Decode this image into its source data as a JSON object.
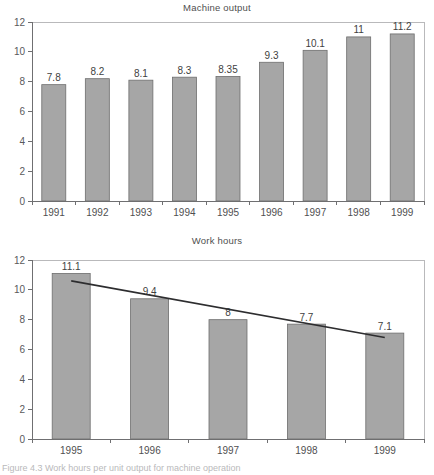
{
  "figure": {
    "caption": "Figure 4.3   Work hours per unit output for machine operation"
  },
  "charts": [
    {
      "id": "machine-output",
      "title": "Machine output"
    },
    {
      "id": "work-hours",
      "title": "Work hours"
    }
  ],
  "chart_data": [
    {
      "type": "bar",
      "title": "Machine output",
      "xlabel": "",
      "ylabel": "",
      "categories": [
        "1991",
        "1992",
        "1993",
        "1994",
        "1995",
        "1996",
        "1997",
        "1998",
        "1999"
      ],
      "values": [
        7.8,
        8.2,
        8.1,
        8.3,
        8.35,
        9.3,
        10.1,
        11,
        11.2
      ],
      "value_labels": [
        "7.8",
        "8.2",
        "8.1",
        "8.3",
        "8.35",
        "9.3",
        "10.1",
        "11",
        "11.2"
      ],
      "ylim": [
        0,
        12
      ],
      "yticks": [
        0,
        2,
        4,
        6,
        8,
        10,
        12
      ],
      "ytick_labels": [
        "0",
        "2",
        "4",
        "6",
        "8",
        "10",
        "12"
      ],
      "grid": false,
      "legend": "none",
      "bar_color": "#a6a6a6",
      "bar_edge_color": "#6e6e6e"
    },
    {
      "type": "bar",
      "title": "Work hours",
      "xlabel": "",
      "ylabel": "",
      "categories": [
        "1995",
        "1996",
        "1997",
        "1998",
        "1999"
      ],
      "values": [
        11.1,
        9.4,
        8,
        7.7,
        7.1
      ],
      "value_labels": [
        "11.1",
        "9.4",
        "8",
        "7.7",
        "7.1"
      ],
      "ylim": [
        0,
        12
      ],
      "yticks": [
        0,
        2,
        4,
        6,
        8,
        10,
        12
      ],
      "ytick_labels": [
        "0",
        "2",
        "4",
        "6",
        "8",
        "10",
        "12"
      ],
      "grid": false,
      "legend": "none",
      "bar_color": "#a6a6a6",
      "bar_edge_color": "#6e6e6e",
      "series": [
        {
          "name": "trend line",
          "type": "line",
          "x": [
            "1995",
            "1999"
          ],
          "values": [
            10.6,
            6.8
          ],
          "color": "#2d2d2f"
        }
      ]
    }
  ]
}
